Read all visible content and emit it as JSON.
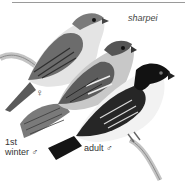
{
  "illustration": {
    "species_label": "sharpei",
    "figures": [
      {
        "id": "female",
        "label": "♀"
      },
      {
        "id": "first-winter-male",
        "label_line1": "1st",
        "label_line2": "winter ♂"
      },
      {
        "id": "adult-male",
        "label": "adult ♂"
      }
    ]
  },
  "colors": {
    "female_back": "#6f6f6f",
    "female_belly": "#e2e2e2",
    "winter_back": "#7c7c7c",
    "adult_head": "#141414",
    "adult_throat": "#f4f4f4",
    "branch": "#b8b8b8"
  }
}
